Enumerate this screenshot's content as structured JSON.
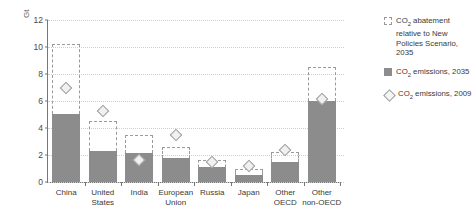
{
  "chart_data": {
    "type": "bar",
    "title": "",
    "xlabel": "",
    "ylabel": "Gt",
    "ylim": [
      0,
      12
    ],
    "yticks": [
      0,
      2,
      4,
      6,
      8,
      10,
      12
    ],
    "grid": true,
    "legend_position": "right",
    "categories": [
      "China",
      "United States",
      "India",
      "European Union",
      "Russia",
      "Japan",
      "Other OECD",
      "Other non-OECD"
    ],
    "series": [
      {
        "name": "CO2 emissions, 2035",
        "style": "solid-bar",
        "color": "#8c8c8c",
        "values": [
          5.05,
          2.3,
          2.15,
          1.75,
          1.1,
          0.5,
          1.45,
          6.0
        ]
      },
      {
        "name": "CO2 abatement relative to New Policies Scenario, 2035",
        "style": "dashed-bar-top",
        "color": "#9a9a9a",
        "values": [
          10.2,
          4.5,
          3.5,
          2.6,
          1.6,
          0.95,
          2.2,
          8.5
        ]
      },
      {
        "name": "CO2 emissions, 2009",
        "style": "diamond-marker",
        "color": "#9a9a9a",
        "values": [
          6.95,
          5.25,
          1.6,
          3.5,
          1.5,
          1.15,
          2.35,
          6.15
        ]
      }
    ]
  },
  "axis": {
    "unit_label": "Gt",
    "tick_labels": [
      "12",
      "10",
      "8",
      "6",
      "4",
      "2",
      "0"
    ]
  },
  "legend": {
    "items": [
      {
        "swatch": "dashed-box",
        "prefix": "CO",
        "sub": "2",
        "text": " abatement relative to New Policies Scenario, 2035"
      },
      {
        "swatch": "solid-box",
        "prefix": "CO",
        "sub": "2",
        "text": " emissions, 2035"
      },
      {
        "swatch": "diamond",
        "prefix": "CO",
        "sub": "2",
        "text": " emissions, 2009"
      }
    ]
  }
}
